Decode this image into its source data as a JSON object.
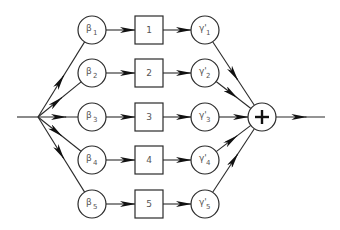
{
  "diagram": {
    "type": "parallel-branch block diagram",
    "input": "input-signal",
    "output": "output-signal",
    "sum_node": {
      "symbol": "+",
      "icon": "sum-plus-icon"
    },
    "branches": [
      {
        "gain_symbol": "β",
        "gain_sub": "1",
        "block_label": "1",
        "out_symbol": "γ'",
        "out_sub": "1"
      },
      {
        "gain_symbol": "β",
        "gain_sub": "2",
        "block_label": "2",
        "out_symbol": "γ'",
        "out_sub": "2"
      },
      {
        "gain_symbol": "β",
        "gain_sub": "3",
        "block_label": "3",
        "out_symbol": "γ'",
        "out_sub": "3"
      },
      {
        "gain_symbol": "β",
        "gain_sub": "4",
        "block_label": "4",
        "out_symbol": "γ'",
        "out_sub": "4"
      },
      {
        "gain_symbol": "β",
        "gain_sub": "5",
        "block_label": "5",
        "out_symbol": "γ'",
        "out_sub": "5"
      }
    ]
  }
}
